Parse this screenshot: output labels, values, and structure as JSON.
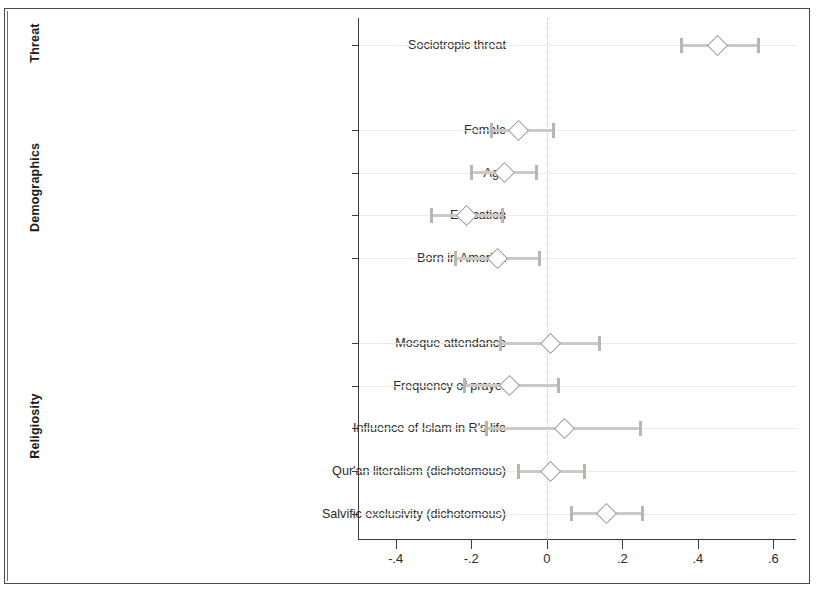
{
  "chart_data": {
    "type": "scatter",
    "title": "",
    "subtitle": "",
    "xlabel": "",
    "ylabel": "",
    "xlim": [
      -0.5,
      0.66
    ],
    "ylim": [
      0,
      1
    ],
    "grid": true,
    "legend": null,
    "marker": "hollow-diamond",
    "error_bars": "95% confidence interval with end caps",
    "zero_reference_line": 0,
    "x_ticks": [
      -0.4,
      -0.2,
      0,
      0.2,
      0.4,
      0.6
    ],
    "x_tick_labels": [
      "-.4",
      "-.2",
      "0",
      ".2",
      ".4",
      ".6"
    ],
    "groups": [
      {
        "name": "Threat",
        "label": "Threat",
        "points": [
          {
            "label": "Sociotropic threat",
            "estimate": 0.452,
            "ci_low": 0.357,
            "ci_high": 0.562
          }
        ]
      },
      {
        "name": "Demographics",
        "label": "Demographics",
        "points": [
          {
            "label": "Female",
            "estimate": -0.075,
            "ci_low": -0.147,
            "ci_high": 0.017
          },
          {
            "label": "Age",
            "estimate": -0.113,
            "ci_low": -0.2,
            "ci_high": -0.027
          },
          {
            "label": "Education",
            "estimate": -0.212,
            "ci_low": -0.306,
            "ci_high": -0.116
          },
          {
            "label": "Born in America",
            "estimate": -0.13,
            "ci_low": -0.243,
            "ci_high": -0.019
          }
        ]
      },
      {
        "name": "Religiosity",
        "label": "Religiosity",
        "points": [
          {
            "label": "Mosque attendance",
            "estimate": 0.01,
            "ci_low": -0.123,
            "ci_high": 0.14
          },
          {
            "label": "Frequency of prayer",
            "estimate": -0.099,
            "ci_low": -0.219,
            "ci_high": 0.031
          },
          {
            "label": "Influence of Islam in R's life",
            "estimate": 0.048,
            "ci_low": -0.161,
            "ci_high": 0.248
          },
          {
            "label": "Qur'an literalism (dichotomous)",
            "estimate": 0.01,
            "ci_low": -0.075,
            "ci_high": 0.099
          },
          {
            "label": "Salvific exclusivity (dichotomous)",
            "estimate": 0.159,
            "ci_low": 0.065,
            "ci_high": 0.253
          }
        ]
      }
    ]
  },
  "colors": {
    "marker_stroke": "#9a9792",
    "whisker": "#cdcac6",
    "cap": "#b9b6b2",
    "axis": "#3b3b3b",
    "gridline": "#eceae8",
    "zero_line": "#c9c6c2",
    "text": "#2b2b2b",
    "frame": "#4a4a4a",
    "background": "#ffffff"
  }
}
